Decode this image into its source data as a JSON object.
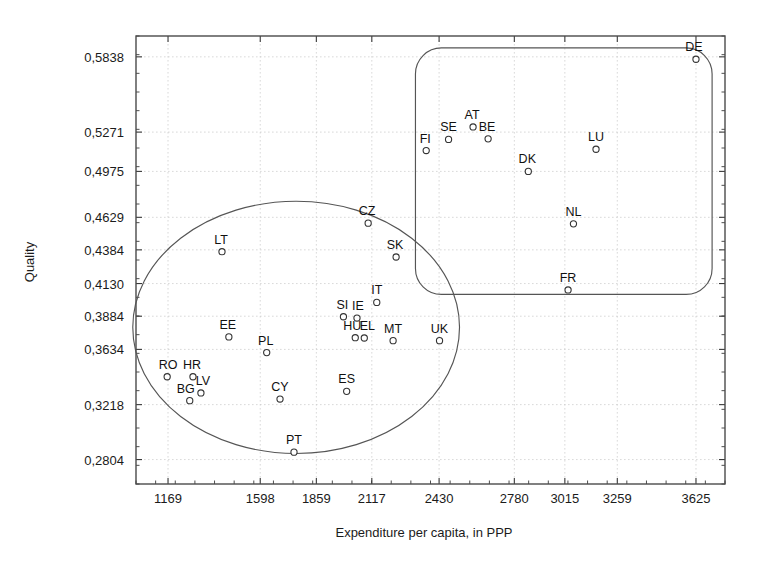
{
  "chart_data": {
    "type": "scatter",
    "title": "",
    "xlabel": "Expenditure per capita, in PPP",
    "ylabel": "Quality",
    "xlim": [
      1020,
      3760
    ],
    "ylim": [
      0.262,
      0.5995
    ],
    "grid": true,
    "legend": "none",
    "decimal_separator": ",",
    "xticks": [
      {
        "label": "1169",
        "value": 1169
      },
      {
        "label": "1598",
        "value": 1598
      },
      {
        "label": "1859",
        "value": 1859
      },
      {
        "label": "2117",
        "value": 2117
      },
      {
        "label": "2430",
        "value": 2430
      },
      {
        "label": "2780",
        "value": 2780
      },
      {
        "label": "3015",
        "value": 3015
      },
      {
        "label": "3259",
        "value": 3259
      },
      {
        "label": "3625",
        "value": 3625
      }
    ],
    "yticks": [
      {
        "label": "0,5838",
        "value": 0.5838
      },
      {
        "label": "0,5271",
        "value": 0.5271
      },
      {
        "label": "0,4975",
        "value": 0.4975
      },
      {
        "label": "0,4629",
        "value": 0.4629
      },
      {
        "label": "0,4384",
        "value": 0.4384
      },
      {
        "label": "0,4130",
        "value": 0.413
      },
      {
        "label": "0,3884",
        "value": 0.3884
      },
      {
        "label": "0,3634",
        "value": 0.3634
      },
      {
        "label": "0,3218",
        "value": 0.3218
      },
      {
        "label": "0,2804",
        "value": 0.2804
      }
    ],
    "points": [
      {
        "label": "DE",
        "x": 3625,
        "y": 0.582,
        "label_dx": -2,
        "label_dy": -8
      },
      {
        "label": "AT",
        "x": 2588,
        "y": 0.531,
        "label_dx": -1,
        "label_dy": -8
      },
      {
        "label": "SE",
        "x": 2474,
        "y": 0.5216,
        "label_dx": 0,
        "label_dy": -8
      },
      {
        "label": "BE",
        "x": 2658,
        "y": 0.522,
        "label_dx": -1,
        "label_dy": -8
      },
      {
        "label": "FI",
        "x": 2370,
        "y": 0.5132,
        "label_dx": -1,
        "label_dy": -8
      },
      {
        "label": "LU",
        "x": 3160,
        "y": 0.5142,
        "label_dx": 0,
        "label_dy": -8
      },
      {
        "label": "DK",
        "x": 2845,
        "y": 0.4975,
        "label_dx": -1,
        "label_dy": -8
      },
      {
        "label": "NL",
        "x": 3055,
        "y": 0.458,
        "label_dx": 0,
        "label_dy": -8
      },
      {
        "label": "FR",
        "x": 3030,
        "y": 0.4082,
        "label_dx": 0,
        "label_dy": -8
      },
      {
        "label": "CZ",
        "x": 2100,
        "y": 0.4585,
        "label_dx": -1,
        "label_dy": -8
      },
      {
        "label": "SK",
        "x": 2230,
        "y": 0.433,
        "label_dx": -1,
        "label_dy": -8
      },
      {
        "label": "LT",
        "x": 1420,
        "y": 0.437,
        "label_dx": -1,
        "label_dy": -8
      },
      {
        "label": "IT",
        "x": 2140,
        "y": 0.3988,
        "label_dx": 0,
        "label_dy": -8
      },
      {
        "label": "SI",
        "x": 1985,
        "y": 0.388,
        "label_dx": -1,
        "label_dy": -8
      },
      {
        "label": "IE",
        "x": 2048,
        "y": 0.387,
        "label_dx": 1,
        "label_dy": -8
      },
      {
        "label": "HU",
        "x": 2040,
        "y": 0.3722,
        "label_dx": -3,
        "label_dy": -8
      },
      {
        "label": "EL",
        "x": 2082,
        "y": 0.372,
        "label_dx": 3,
        "label_dy": -8
      },
      {
        "label": "MT",
        "x": 2216,
        "y": 0.37,
        "label_dx": 0,
        "label_dy": -8
      },
      {
        "label": "UK",
        "x": 2432,
        "y": 0.37,
        "label_dx": 0,
        "label_dy": -8
      },
      {
        "label": "EE",
        "x": 1452,
        "y": 0.3728,
        "label_dx": -1,
        "label_dy": -8
      },
      {
        "label": "PL",
        "x": 1628,
        "y": 0.361,
        "label_dx": -1,
        "label_dy": -8
      },
      {
        "label": "RO",
        "x": 1165,
        "y": 0.3428,
        "label_dx": 1,
        "label_dy": -8
      },
      {
        "label": "HR",
        "x": 1285,
        "y": 0.3428,
        "label_dx": -1,
        "label_dy": -8
      },
      {
        "label": "LV",
        "x": 1322,
        "y": 0.3306,
        "label_dx": 2,
        "label_dy": -8
      },
      {
        "label": "BG",
        "x": 1270,
        "y": 0.3248,
        "label_dx": -4,
        "label_dy": -8
      },
      {
        "label": "CY",
        "x": 1690,
        "y": 0.326,
        "label_dx": 0,
        "label_dy": -8
      },
      {
        "label": "ES",
        "x": 2000,
        "y": 0.3318,
        "label_dx": 0,
        "label_dy": -8
      },
      {
        "label": "PT",
        "x": 1755,
        "y": 0.286,
        "label_dx": 0,
        "label_dy": -8
      }
    ],
    "cluster_shapes": [
      {
        "name": "left-ellipse",
        "type": "ellipse",
        "cx": 1765,
        "cy": 0.38,
        "rx": 760,
        "ry": 0.095
      },
      {
        "name": "right-rounded-rect",
        "type": "rounded-rect",
        "x0": 2320,
        "y0": 0.4048,
        "x1": 3700,
        "y1": 0.5905,
        "corner": 26
      }
    ]
  }
}
